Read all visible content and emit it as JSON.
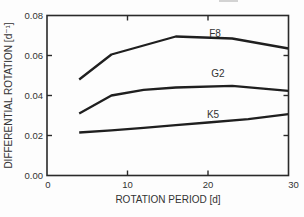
{
  "figure": {
    "background": "#fdfdfd",
    "line_color": "#1f1f1f",
    "frame_color": "#2a2a2a",
    "text_color": "#333333"
  },
  "chart_data": {
    "type": "line",
    "title": "",
    "xlabel": "ROTATION PERIOD [d]",
    "ylabel": "DIFFERENTIAL ROTATION [d⁻¹]",
    "xlim": [
      0,
      30
    ],
    "ylim": [
      0,
      0.08
    ],
    "xticks": [
      0,
      10,
      20,
      30
    ],
    "xtick_labels": [
      "0",
      "10",
      "20",
      "30"
    ],
    "yticks": [
      0,
      0.02,
      0.04,
      0.06,
      0.08
    ],
    "ytick_labels": [
      "0.00",
      "0.02",
      "0.04",
      "0.06",
      "0.08"
    ],
    "grid": false,
    "frame": "box-with-inward-ticks",
    "legend": "inline-curve-labels",
    "series": [
      {
        "name": "F8",
        "x": [
          4,
          8,
          16,
          23,
          30
        ],
        "y": [
          0.048,
          0.0605,
          0.0695,
          0.0685,
          0.0635
        ]
      },
      {
        "name": "G2",
        "x": [
          4,
          8,
          12,
          16,
          23,
          30
        ],
        "y": [
          0.031,
          0.04,
          0.0428,
          0.044,
          0.0448,
          0.0423
        ]
      },
      {
        "name": "K5",
        "x": [
          4,
          8,
          12,
          16,
          20,
          25,
          30
        ],
        "y": [
          0.0215,
          0.0226,
          0.0238,
          0.0252,
          0.0265,
          0.0282,
          0.0307
        ]
      }
    ]
  },
  "layout_hints": {
    "plot": {
      "left": 47,
      "top": 15.5,
      "right": 288.5,
      "bottom": 175.5
    },
    "tick_length": 5,
    "xtick_dx": [
      1,
      0,
      0,
      5
    ],
    "series_label_pos": [
      {
        "x": 215,
        "y": 36.5
      },
      {
        "x": 218,
        "y": 76.5
      },
      {
        "x": 213,
        "y": 118
      }
    ]
  }
}
